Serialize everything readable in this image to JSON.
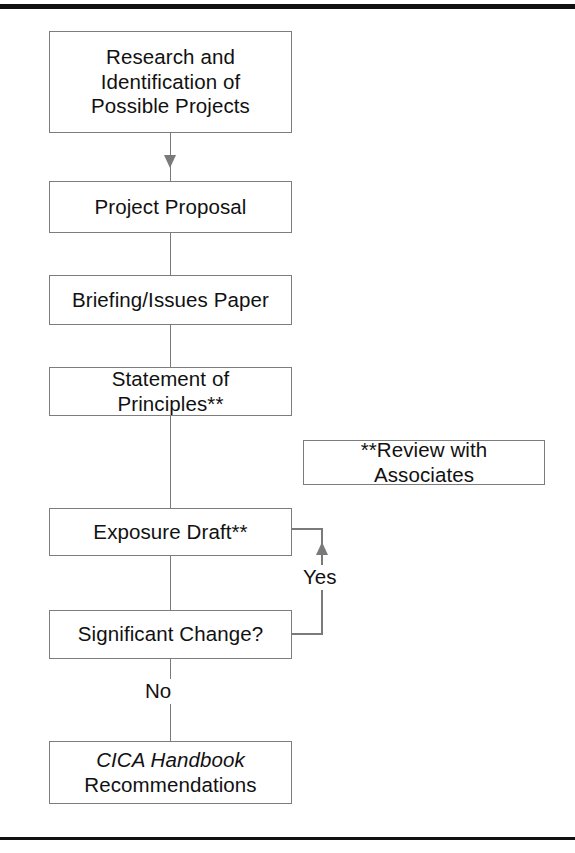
{
  "diagram": {
    "line_color": "#7a7a7a",
    "text_color": "#111111",
    "background": "#ffffff"
  },
  "nodes": [
    {
      "id": "research",
      "label": "Research and Identification of Possible Projects",
      "lines": [
        "Research and",
        "Identification of",
        "Possible Projects"
      ]
    },
    {
      "id": "proposal",
      "label": "Project Proposal",
      "lines": [
        "Project Proposal"
      ]
    },
    {
      "id": "briefing",
      "label": "Briefing/Issues Paper",
      "lines": [
        "Briefing/Issues Paper"
      ]
    },
    {
      "id": "principles",
      "label": "Statement of Principles**",
      "lines": [
        "Statement of Principles**"
      ]
    },
    {
      "id": "exposure",
      "label": "Exposure Draft**",
      "lines": [
        "Exposure Draft**"
      ]
    },
    {
      "id": "significant",
      "label": "Significant Change?",
      "lines": [
        "Significant Change?"
      ]
    },
    {
      "id": "handbook",
      "label": "CICA Handbook Recommendations",
      "lines": [
        "CICA Handbook",
        "Recommendations"
      ]
    }
  ],
  "note": {
    "id": "review-note",
    "label": "**Review with Associates"
  },
  "edge_labels": {
    "yes": "Yes",
    "no": "No"
  }
}
